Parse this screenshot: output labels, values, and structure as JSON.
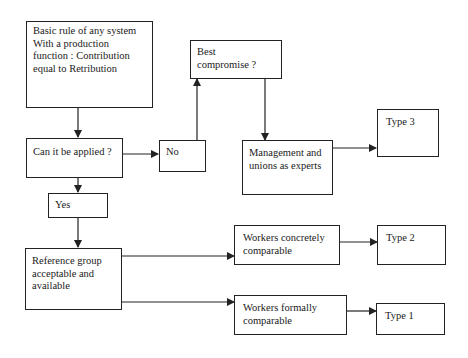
{
  "diagram": {
    "nodes": {
      "basic_rule": "Basic rule of any system\nWith a production\nfunction : Contribution\nequal to Retribution",
      "can_apply": "Can it be applied ?",
      "no": "No",
      "yes": "Yes",
      "best_compromise": "Best\ncompromise ?",
      "management_unions": "Management and\nunions as experts",
      "type3": "Type 3",
      "reference_group": "Reference group\nacceptable and\navailable",
      "workers_concretely": "Workers concretely\ncomparable",
      "type2": "Type 2",
      "workers_formally": "Workers formally\ncomparable",
      "type1": "Type 1"
    },
    "edges": [
      {
        "from": "basic_rule",
        "to": "can_apply"
      },
      {
        "from": "can_apply",
        "to": "no"
      },
      {
        "from": "can_apply",
        "to": "yes"
      },
      {
        "from": "no",
        "to": "best_compromise"
      },
      {
        "from": "best_compromise",
        "to": "management_unions"
      },
      {
        "from": "management_unions",
        "to": "type3"
      },
      {
        "from": "yes",
        "to": "reference_group"
      },
      {
        "from": "reference_group",
        "to": "workers_concretely"
      },
      {
        "from": "reference_group",
        "to": "workers_formally"
      },
      {
        "from": "workers_concretely",
        "to": "type2"
      },
      {
        "from": "workers_formally",
        "to": "type1"
      }
    ]
  }
}
